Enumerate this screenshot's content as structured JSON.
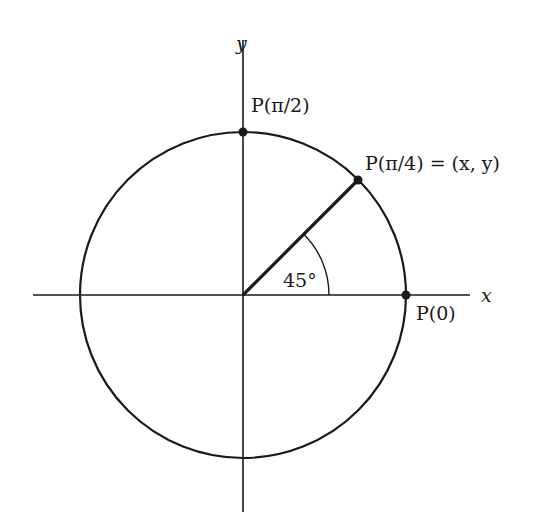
{
  "diagram": {
    "type": "unit-circle",
    "axes": {
      "x_label": "x",
      "y_label": "y"
    },
    "points": [
      {
        "id": "p0",
        "label": "P(0)"
      },
      {
        "id": "p_pi2",
        "label": "P(π/2)"
      },
      {
        "id": "p_pi4",
        "label": "P(π/4) = (x, y)"
      }
    ],
    "angle_label": "45°",
    "colors": {
      "stroke": "#1a1a1a",
      "background": "#ffffff"
    }
  }
}
